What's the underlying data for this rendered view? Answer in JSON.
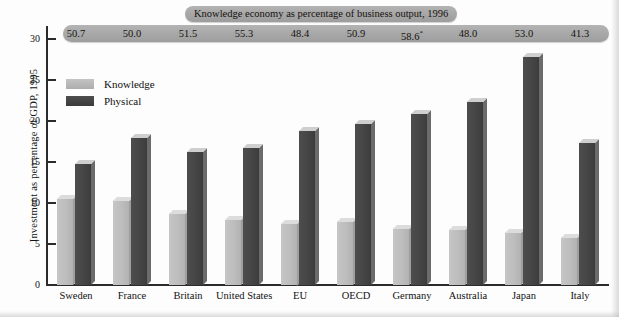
{
  "chart_data": {
    "type": "bar",
    "title": "",
    "xlabel": "",
    "ylabel": "Investment as percentage of GDP, 1995",
    "ylim": [
      0,
      32
    ],
    "yticks": [
      0,
      5,
      10,
      15,
      20,
      25,
      30
    ],
    "grid": false,
    "legend_position": "inside-top-left",
    "categories": [
      "Sweden",
      "France",
      "Britain",
      "United States",
      "EU",
      "OECD",
      "Germany",
      "Australia",
      "Japan",
      "Italy"
    ],
    "series": [
      {
        "name": "Knowledge",
        "color": "#bdbdbd",
        "values": [
          10.5,
          10.2,
          8.6,
          7.9,
          7.5,
          7.7,
          6.8,
          6.7,
          6.3,
          5.7
        ]
      },
      {
        "name": "Physical",
        "color": "#454545",
        "values": [
          14.8,
          17.9,
          16.2,
          16.7,
          18.8,
          19.6,
          20.9,
          22.3,
          27.8,
          17.3
        ]
      }
    ],
    "annotation_band": {
      "title": "Knowledge economy as percentage of business output, 1996",
      "values": [
        "50.7",
        "50.0",
        "51.5",
        "55.3",
        "48.4",
        "50.9",
        "58.6*",
        "48.0",
        "53.0",
        "41.3"
      ],
      "footnote_marker": "*"
    }
  },
  "banner": {
    "title": "Knowledge economy as percentage of business output, 1996",
    "values": [
      {
        "text": "50.7",
        "sup": ""
      },
      {
        "text": "50.0",
        "sup": ""
      },
      {
        "text": "51.5",
        "sup": ""
      },
      {
        "text": "55.3",
        "sup": ""
      },
      {
        "text": "48.4",
        "sup": ""
      },
      {
        "text": "50.9",
        "sup": ""
      },
      {
        "text": "58.6",
        "sup": "*"
      },
      {
        "text": "48.0",
        "sup": ""
      },
      {
        "text": "53.0",
        "sup": ""
      },
      {
        "text": "41.3",
        "sup": ""
      }
    ]
  },
  "axes": {
    "y_title": "Investment as percentage of GDP, 1995",
    "y_ticks": [
      "30",
      "25",
      "20",
      "15",
      "10",
      "5",
      "0"
    ]
  },
  "legend": {
    "items": [
      {
        "label": "Knowledge",
        "key": "knowledge"
      },
      {
        "label": "Physical",
        "key": "physical"
      }
    ]
  }
}
